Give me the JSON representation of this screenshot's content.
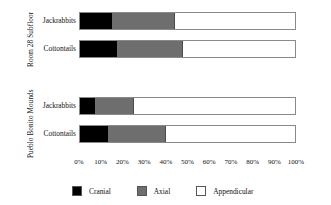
{
  "chart_data": {
    "type": "bar",
    "orientation": "horizontal",
    "stacked": true,
    "normalized": true,
    "title": "",
    "xlabel": "",
    "ylabel": "",
    "xlim": [
      0,
      100
    ],
    "grid": false,
    "legend_position": "bottom",
    "categories": [
      "Cranial",
      "Axial",
      "Appendicular"
    ],
    "tick_labels": [
      "0%",
      "10%",
      "20%",
      "30%",
      "40%",
      "50%",
      "60%",
      "70%",
      "80%",
      "90%",
      "100%"
    ],
    "tick_values": [
      0,
      10,
      20,
      30,
      40,
      50,
      60,
      70,
      80,
      90,
      100
    ],
    "groups": [
      {
        "label": "Room 28 Subfloor",
        "rows": [
          {
            "label": "Jackrabbits",
            "values": [
              15,
              29,
              56
            ]
          },
          {
            "label": "Cottontails",
            "values": [
              17,
              31,
              52
            ]
          }
        ]
      },
      {
        "label": "Pueblo Bonito Mounds",
        "rows": [
          {
            "label": "Jackrabbits",
            "values": [
              7,
              18,
              75
            ]
          },
          {
            "label": "Cottontails",
            "values": [
              13,
              27,
              60
            ]
          }
        ]
      }
    ],
    "legend": [
      {
        "label": "Cranial",
        "color": "#000000"
      },
      {
        "label": "Axial",
        "color": "#6e6e6e"
      },
      {
        "label": "Appendicular",
        "color": "#ffffff"
      }
    ]
  }
}
